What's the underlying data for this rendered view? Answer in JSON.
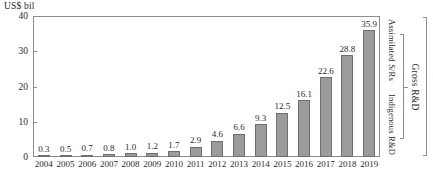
{
  "chart_data": {
    "type": "bar",
    "title": "",
    "unit_caption": "US$ bil",
    "xlabel": "",
    "ylabel": "",
    "ylim": [
      0,
      40
    ],
    "yticks": [
      0,
      10,
      20,
      30,
      40
    ],
    "grid": false,
    "legend_position": "right-vertical-brackets",
    "categories": [
      "2004",
      "2005",
      "2006",
      "2007",
      "2008",
      "2009",
      "2010",
      "2011",
      "2012",
      "2013",
      "2014",
      "2015",
      "2016",
      "2017",
      "2018",
      "2019"
    ],
    "values": [
      0.3,
      0.5,
      0.7,
      0.8,
      1.0,
      1.2,
      1.7,
      2.9,
      4.6,
      6.6,
      9.3,
      12.5,
      16.1,
      22.6,
      28.8,
      35.9
    ],
    "value_labels": [
      "0.3",
      "0.5",
      "0.7",
      "0.8",
      "1.0",
      "1.2",
      "1.7",
      "2.9",
      "4.6",
      "6.6",
      "9.3",
      "12.5",
      "16.1",
      "22.6",
      "28.8",
      "35.9"
    ],
    "annotations": [
      "Assimilated S/Rs",
      "Indigenous R&D",
      "Gross R&D"
    ],
    "bar_color": "#9b9b9b",
    "bar_border_color": "#6f6f6f",
    "axis_color": "#8d8d8d"
  },
  "annotations": {
    "assimilated": "Assimilated S/Rs",
    "indigenous": "Indigenous R&D",
    "gross": "Gross R&D"
  }
}
